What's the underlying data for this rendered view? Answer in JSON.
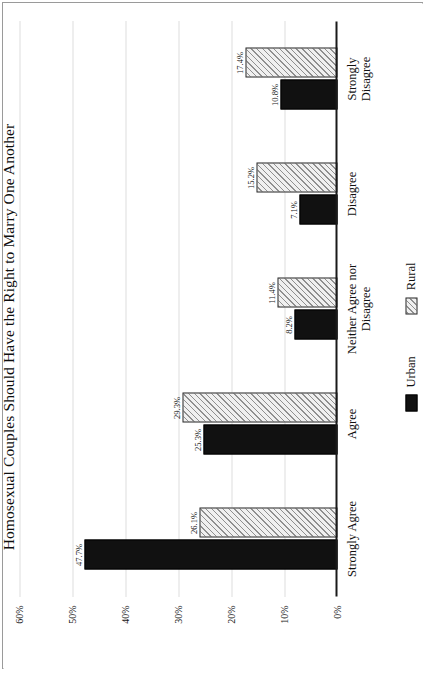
{
  "chart_data": {
    "type": "bar",
    "orientation": "vertical-rendered-rotated",
    "title": "Homosexual Couples Should Have the Right to Marry One Another",
    "xlabel": "",
    "ylabel": "",
    "grid": true,
    "legend_position": "bottom",
    "ylim": [
      0,
      60
    ],
    "yticks": [
      0,
      10,
      20,
      30,
      40,
      50,
      60
    ],
    "ytick_labels": [
      "0%",
      "10%",
      "20%",
      "30%",
      "40%",
      "50%",
      "60%"
    ],
    "categories": [
      "Strongly Agree",
      "Agree",
      "Neither Agree nor\nDisagree",
      "Disagree",
      "Strongly Disagree"
    ],
    "series": [
      {
        "name": "Urban",
        "color": "#111111",
        "pattern": "solid",
        "values": [
          47.7,
          25.3,
          8.2,
          7.1,
          10.8
        ],
        "value_labels": [
          "47.7%",
          "25.3%",
          "8.2%",
          "7.1%",
          "10.8%"
        ]
      },
      {
        "name": "Rural",
        "color": "#f0f0f0",
        "pattern": "diagonal-hatch",
        "values": [
          26.1,
          29.3,
          11.4,
          15.2,
          17.4
        ],
        "value_labels": [
          "26.1%",
          "29.3%",
          "11.4%",
          "15.2%",
          "17.4%"
        ]
      }
    ]
  },
  "legend": {
    "items": [
      {
        "label": "Urban"
      },
      {
        "label": "Rural"
      }
    ]
  }
}
